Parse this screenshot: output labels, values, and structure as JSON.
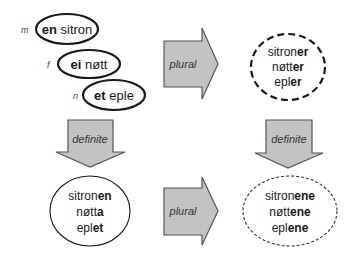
{
  "colors": {
    "arrow_fill": "#c3c3c3",
    "arrow_stroke": "#555555",
    "ellipse_stroke": "#1a1a1a",
    "text": "#1a1a1a"
  },
  "indefinite_singular": [
    {
      "gender": "m",
      "article": "en",
      "noun": " sitron"
    },
    {
      "gender": "f",
      "article": "ei",
      "noun": " nøtt"
    },
    {
      "gender": "n",
      "article": "et",
      "noun": " eple"
    }
  ],
  "indefinite_plural": [
    {
      "stem": "sitron",
      "ending": "er"
    },
    {
      "stem": "nøtt",
      "ending": "er"
    },
    {
      "stem": "epl",
      "ending": "er"
    }
  ],
  "definite_singular": [
    {
      "stem": "sitron",
      "ending": "en"
    },
    {
      "stem": "nøtt",
      "ending": "a"
    },
    {
      "stem": "epl",
      "ending": "et"
    }
  ],
  "definite_plural": [
    {
      "stem": "sitron",
      "ending": "ene"
    },
    {
      "stem": "nøtt",
      "ending": "ene"
    },
    {
      "stem": "epl",
      "ending": "ene"
    }
  ],
  "arrows": {
    "top_plural": "plural",
    "bottom_plural": "plural",
    "left_definite": "definite",
    "right_definite": "definite"
  }
}
